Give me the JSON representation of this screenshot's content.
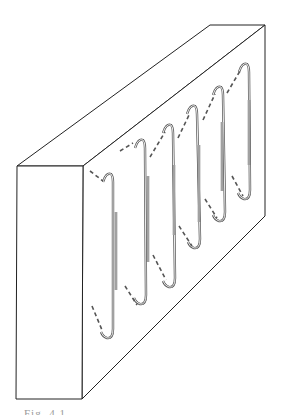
{
  "figure": {
    "stroke_color": "#222222",
    "hook_color": "#555555",
    "background": "#ffffff",
    "block": {
      "front_face": [
        [
          17,
          166
        ],
        [
          83,
          166
        ],
        [
          82,
          399
        ],
        [
          16,
          399
        ]
      ],
      "top_face": [
        [
          17,
          166
        ],
        [
          210,
          25
        ],
        [
          265,
          25
        ],
        [
          83,
          166
        ]
      ],
      "right_face": [
        [
          83,
          166
        ],
        [
          265,
          25
        ],
        [
          265,
          216
        ],
        [
          82,
          399
        ]
      ]
    },
    "hooks": [
      {
        "top": [
          109,
          176
        ],
        "bottom": [
          110,
          337
        ],
        "bar": [
          116,
          212,
          116,
          290
        ],
        "dash_top": [
          [
            90,
            171
          ],
          [
            103,
            181
          ]
        ],
        "dash_bottom": [
          [
            92,
            306
          ],
          [
            102,
            330
          ]
        ]
      },
      {
        "top": [
          141,
          142
        ],
        "bottom": [
          143,
          303
        ],
        "bar": [
          148,
          176,
          148,
          262
        ],
        "dash_top": [
          [
            120,
            151
          ],
          [
            133,
            143
          ]
        ],
        "dash_bottom": [
          [
            125,
            286
          ],
          [
            137,
            305
          ]
        ]
      },
      {
        "top": [
          169,
          127
        ],
        "bottom": [
          172,
          286
        ],
        "bar": [
          174,
          165,
          174,
          235
        ],
        "dash_top": [
          [
            150,
            157
          ],
          [
            165,
            132
          ]
        ],
        "dash_bottom": [
          [
            153,
            255
          ],
          [
            166,
            280
          ]
        ]
      },
      {
        "top": [
          193,
          108
        ],
        "bottom": [
          197,
          247
        ],
        "bar": [
          199,
          145,
          199,
          222
        ],
        "dash_top": [
          [
            178,
            138
          ],
          [
            190,
            113
          ]
        ],
        "dash_bottom": [
          [
            179,
            226
          ],
          [
            192,
            246
          ]
        ]
      },
      {
        "top": [
          219,
          89
        ],
        "bottom": [
          222,
          220
        ],
        "bar": [
          222,
          122,
          222,
          191
        ],
        "dash_top": [
          [
            203,
            120
          ],
          [
            215,
            94
          ]
        ],
        "dash_bottom": [
          [
            205,
            199
          ],
          [
            217,
            218
          ]
        ]
      },
      {
        "top": [
          245,
          66
        ],
        "bottom": [
          247,
          198
        ],
        "bar": [
          249,
          100,
          249,
          165
        ],
        "dash_top": [
          [
            227,
            93
          ],
          [
            240,
            71
          ]
        ],
        "dash_bottom": [
          [
            232,
            176
          ],
          [
            243,
            196
          ]
        ]
      }
    ]
  },
  "caption": {
    "text": "Fig. 4.1"
  }
}
